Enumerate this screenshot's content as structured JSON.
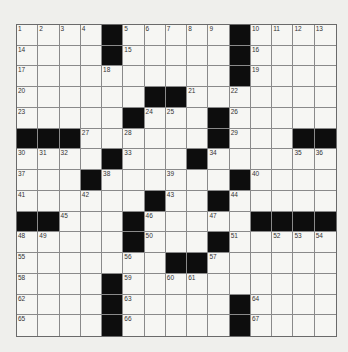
{
  "puzzle": {
    "size": 15,
    "rows": [
      [
        "1",
        "2",
        "3",
        "4",
        "#",
        "5",
        "6",
        "7",
        "8",
        "9",
        "#",
        "10",
        "11",
        "12",
        "13"
      ],
      [
        "14",
        "",
        "",
        "",
        "#",
        "15",
        "",
        "",
        "",
        "",
        "#",
        "16",
        "",
        "",
        ""
      ],
      [
        "17",
        "",
        "",
        "",
        "18",
        "",
        "",
        "",
        "",
        "",
        "#",
        "19",
        "",
        "",
        ""
      ],
      [
        "20",
        "",
        "",
        "",
        "",
        "",
        "#",
        "#",
        "21",
        "",
        "22",
        "",
        "",
        "",
        ""
      ],
      [
        "23",
        "",
        "",
        "",
        "",
        "#",
        "24",
        "25",
        "",
        "#",
        "26",
        "",
        "",
        "",
        ""
      ],
      [
        "#",
        "#",
        "#",
        "27",
        "",
        "28",
        "",
        "",
        "",
        "#",
        "29",
        "",
        "",
        "#",
        "#"
      ],
      [
        "30",
        "31",
        "32",
        "",
        "#",
        "33",
        "",
        "",
        "#",
        "34",
        "",
        "",
        "",
        "35",
        "36"
      ],
      [
        "37",
        "",
        "",
        "#",
        "38",
        "",
        "",
        "39",
        "",
        "",
        "#",
        "40",
        "",
        "",
        ""
      ],
      [
        "41",
        "",
        "",
        "42",
        "",
        "",
        "#",
        "43",
        "",
        "#",
        "44",
        "",
        "",
        "",
        ""
      ],
      [
        "#",
        "#",
        "45",
        "",
        "",
        "#",
        "46",
        "",
        "",
        "47",
        "",
        "#",
        "#",
        "#",
        "#"
      ],
      [
        "48",
        "49",
        "",
        "",
        "",
        "#",
        "50",
        "",
        "",
        "#",
        "51",
        "",
        "52",
        "53",
        "54"
      ],
      [
        "55",
        "",
        "",
        "",
        "",
        "56",
        "",
        "#",
        "#",
        "57",
        "",
        "",
        "",
        "",
        ""
      ],
      [
        "58",
        "",
        "",
        "",
        "#",
        "59",
        "",
        "60",
        "61",
        "",
        "",
        "",
        "",
        "",
        ""
      ],
      [
        "62",
        "",
        "",
        "",
        "#",
        "63",
        "",
        "",
        "",
        "",
        "#",
        "64",
        "",
        "",
        ""
      ],
      [
        "65",
        "",
        "",
        "",
        "#",
        "66",
        "",
        "",
        "",
        "",
        "#",
        "67",
        "",
        "",
        ""
      ]
    ]
  },
  "colors": {
    "paper": "#efefec",
    "cell": "#f6f6f3",
    "black": "#0d0d0d",
    "line": "#8a8a8a"
  }
}
